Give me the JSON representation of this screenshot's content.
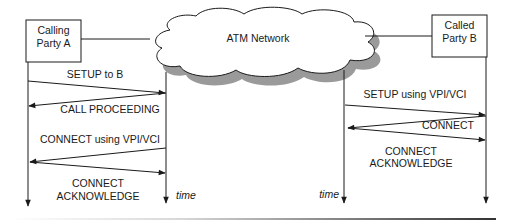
{
  "diagram": {
    "type": "sequence",
    "parties": {
      "calling": {
        "line1": "Calling",
        "line2": "Party A"
      },
      "called": {
        "line1": "Called",
        "line2": "Party B"
      },
      "network": "ATM Network"
    },
    "left_exchange": {
      "messages": [
        {
          "label": "SETUP to B",
          "direction": "A->network"
        },
        {
          "label": "CALL PROCEEDING",
          "direction": "network->A"
        },
        {
          "label": "CONNECT using VPI/VCI",
          "direction": "network->A"
        },
        {
          "label_line1": "CONNECT",
          "label_line2": "ACKNOWLEDGE",
          "direction": "A->network"
        }
      ],
      "time_label": "time"
    },
    "right_exchange": {
      "messages": [
        {
          "label": "SETUP using VPI/VCI",
          "direction": "network->B"
        },
        {
          "label": "CONNECT",
          "direction": "B->network"
        },
        {
          "label_line1": "CONNECT",
          "label_line2": "ACKNOWLEDGE",
          "direction": "network->B"
        }
      ],
      "time_label": "time"
    },
    "colors": {
      "stroke": "#1a1a1a",
      "cloud_shadow": "#9a9a9a",
      "background": "#ffffff"
    }
  }
}
